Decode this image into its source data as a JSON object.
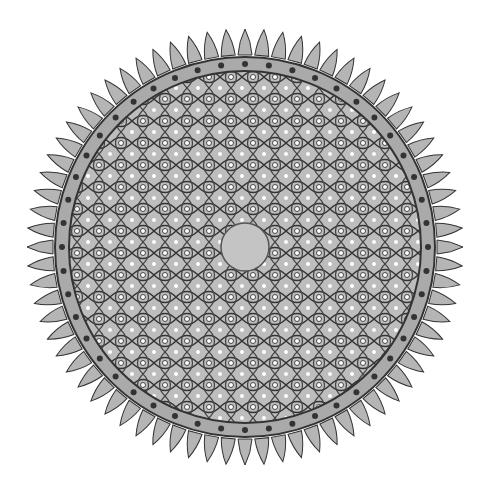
{
  "image": {
    "subject": "ornamental circular rosette with interlaced arabesque pattern",
    "colors": {
      "background": "#ffffff",
      "metal": "#b8b8b8",
      "dark": "#3a3a3a",
      "boss": "#c4c4c4"
    }
  }
}
